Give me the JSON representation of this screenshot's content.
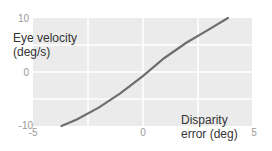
{
  "chart_data": {
    "type": "line",
    "title": "",
    "xlabel": "Disparity error (deg)",
    "ylabel": "Eye velocity (deg/s)",
    "xlabel_lines": [
      "Disparity",
      "error (deg)"
    ],
    "ylabel_lines": [
      "Eye velocity",
      "(deg/s)"
    ],
    "xlim": [
      -5,
      5
    ],
    "ylim": [
      -10,
      10
    ],
    "x_ticks": [
      "-5",
      "0",
      "5"
    ],
    "y_ticks": [
      "10",
      "0",
      "-10"
    ],
    "grid": true,
    "series": [
      {
        "name": "eye velocity",
        "color": "#6e6e6e",
        "x": [
          -3.7,
          -3.0,
          -2.0,
          -1.0,
          0.0,
          1.0,
          2.0,
          3.0,
          3.9
        ],
        "y": [
          -10.0,
          -8.8,
          -6.6,
          -3.9,
          -0.8,
          2.6,
          5.4,
          7.8,
          10.0
        ]
      }
    ]
  }
}
